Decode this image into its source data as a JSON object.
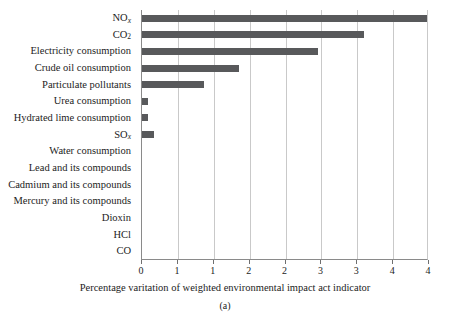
{
  "chart_data": {
    "type": "bar",
    "orientation": "horizontal",
    "title": "",
    "xlabel": "Percentage varitation of weighted environmental impact act indicator",
    "ylabel": "",
    "xlim": [
      0,
      4
    ],
    "xticks": [
      0,
      1,
      1,
      2,
      2,
      3,
      3,
      4,
      4
    ],
    "grid": "vertical",
    "legend": "none",
    "bar_color": "#58595b",
    "categories": [
      "NOx",
      "CO2",
      "Electricity consumption",
      "Crude oil consumption",
      "Particulate pollutants",
      "Urea consumption",
      "Hydrated lime consumption",
      "SOx",
      "Water consumption",
      "Lead and its compounds",
      "Cadmium and its compounds",
      "Mercury and its compounds",
      "Dioxin",
      "HCl",
      "CO"
    ],
    "values": [
      4.2,
      3.1,
      2.45,
      1.35,
      0.87,
      0.08,
      0.08,
      0.17,
      0.0,
      0.0,
      0.0,
      0.0,
      0.0,
      0.0,
      0.0
    ]
  },
  "axis": {
    "tick_labels": [
      "0",
      "1",
      "1",
      "2",
      "2",
      "3",
      "3",
      "4",
      "4"
    ],
    "x_title": "Percentage varitation of weighted environmental impact act indicator"
  },
  "category_labels": [
    {
      "text": "NO",
      "sub": "x",
      "sub_italic": true
    },
    {
      "text": "CO",
      "sub": "2",
      "sub_italic": false
    },
    {
      "text": "Electricity consumption",
      "sub": "",
      "sub_italic": false
    },
    {
      "text": "Crude oil consumption",
      "sub": "",
      "sub_italic": false
    },
    {
      "text": "Particulate pollutants",
      "sub": "",
      "sub_italic": false
    },
    {
      "text": "Urea consumption",
      "sub": "",
      "sub_italic": false
    },
    {
      "text": "Hydrated lime consumption",
      "sub": "",
      "sub_italic": false
    },
    {
      "text": "SO",
      "sub": "x",
      "sub_italic": true
    },
    {
      "text": "Water consumption",
      "sub": "",
      "sub_italic": false
    },
    {
      "text": "Lead and its compounds",
      "sub": "",
      "sub_italic": false
    },
    {
      "text": "Cadmium and its compounds",
      "sub": "",
      "sub_italic": false
    },
    {
      "text": "Mercury and its compounds",
      "sub": "",
      "sub_italic": false
    },
    {
      "text": "Dioxin",
      "sub": "",
      "sub_italic": false
    },
    {
      "text": "HCl",
      "sub": "",
      "sub_italic": false
    },
    {
      "text": "CO",
      "sub": "",
      "sub_italic": false
    }
  ],
  "caption": "(a)"
}
